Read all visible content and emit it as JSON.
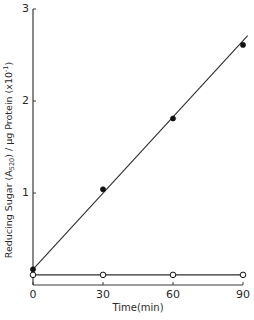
{
  "chart_data": {
    "type": "scatter",
    "title": "",
    "xlabel": "Time(min)",
    "ylabel": "Reducing Sugar (A520) / μg Protein (x10⁻¹)",
    "ylabel_parts": {
      "prefix": "Reducing Sugar (A",
      "subscript": "520",
      "middle": ") / μg Protein (x10",
      "superscript": "-1",
      "suffix": ")"
    },
    "xlim": [
      0,
      90
    ],
    "ylim": [
      0,
      3
    ],
    "x_ticks": [
      0,
      30,
      60,
      90
    ],
    "x_tick_labels": [
      "0",
      "30",
      "60",
      "90"
    ],
    "y_ticks": [
      1,
      2,
      3
    ],
    "y_tick_labels": [
      "1",
      "2",
      "3"
    ],
    "grid": false,
    "legend": null,
    "x": [
      0,
      30,
      60,
      90
    ],
    "series": [
      {
        "name": "filled circles",
        "marker": "filled-circle",
        "values": [
          0.17,
          1.04,
          1.81,
          2.61
        ],
        "fit_line": {
          "x0": 0,
          "y0": 0.17,
          "x1": 92,
          "y1": 2.71
        }
      },
      {
        "name": "open circles",
        "marker": "open-circle",
        "values": [
          0.11,
          0.11,
          0.11,
          0.11
        ],
        "fit_line": {
          "x0": 0,
          "y0": 0.11,
          "x1": 90,
          "y1": 0.11
        }
      }
    ]
  },
  "style": {
    "axis_color": "#3a3a3a",
    "line_color": "#2e2e2e",
    "marker_color": "#111111"
  },
  "layout": {
    "x_px": {
      "x0": 33,
      "x1": 243
    },
    "y_px": {
      "y0": 285,
      "y3": 9
    }
  }
}
